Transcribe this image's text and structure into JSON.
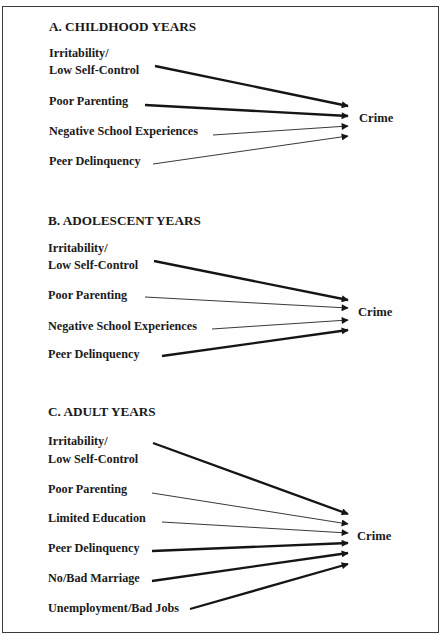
{
  "figure": {
    "sections": [
      {
        "id": "A",
        "title": "A. CHILDHOOD YEARS",
        "outcome": "Crime",
        "predictors": [
          {
            "label_lines": [
              "Irritability/",
              "Low Self-Control"
            ],
            "effect": "strong"
          },
          {
            "label_lines": [
              "Poor Parenting"
            ],
            "effect": "strong"
          },
          {
            "label_lines": [
              "Negative School Experiences"
            ],
            "effect": "weak"
          },
          {
            "label_lines": [
              "Peer Delinquency"
            ],
            "effect": "weak"
          }
        ]
      },
      {
        "id": "B",
        "title": "B. ADOLESCENT YEARS",
        "outcome": "Crime",
        "predictors": [
          {
            "label_lines": [
              "Irritability/",
              "Low Self-Control"
            ],
            "effect": "strong"
          },
          {
            "label_lines": [
              "Poor Parenting"
            ],
            "effect": "weak"
          },
          {
            "label_lines": [
              "Negative School Experiences"
            ],
            "effect": "weak"
          },
          {
            "label_lines": [
              "Peer Delinquency"
            ],
            "effect": "strong"
          }
        ]
      },
      {
        "id": "C",
        "title": "C. ADULT YEARS",
        "outcome": "Crime",
        "predictors": [
          {
            "label_lines": [
              "Irritability/",
              "Low Self-Control"
            ],
            "effect": "strong"
          },
          {
            "label_lines": [
              "Poor Parenting"
            ],
            "effect": "weak"
          },
          {
            "label_lines": [
              "Limited Education"
            ],
            "effect": "weak"
          },
          {
            "label_lines": [
              "Peer Delinquency"
            ],
            "effect": "strong"
          },
          {
            "label_lines": [
              "No/Bad Marriage"
            ],
            "effect": "strong"
          },
          {
            "label_lines": [
              "Unemployment/Bad Jobs"
            ],
            "effect": "strong"
          }
        ]
      }
    ],
    "colors": {
      "ink": "#1a1a1a",
      "border": "#3a3a3a",
      "background": "#ffffff"
    }
  }
}
